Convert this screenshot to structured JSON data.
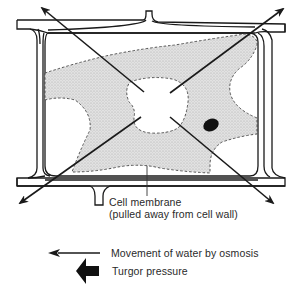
{
  "diagram": {
    "labels": {
      "membrane_line1": "Cell membrane",
      "membrane_line2": "(pulled away from cell wall)"
    },
    "legend": {
      "items": [
        {
          "symbol": "thin-arrow-left-icon",
          "label": "Movement of water by osmosis"
        },
        {
          "symbol": "thick-arrow-left-icon",
          "label": "Turgor pressure"
        }
      ]
    },
    "colors": {
      "line": "#1a1a1a",
      "cytoplasm": "#d9d9d9",
      "background": "#ffffff",
      "nucleus": "#111111"
    }
  }
}
